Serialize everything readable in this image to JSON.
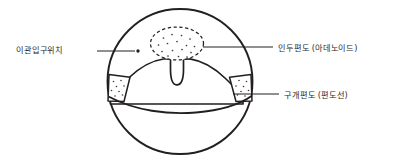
{
  "figure": {
    "background_color": "#ffffff",
    "line_color": "#231f20",
    "text_color": "#2b2b2b",
    "stipple_color": "#3a3a3a"
  },
  "labels": {
    "eustachian_opening": "이관입구위치",
    "adenoid": "인두편도 (아데노이드)",
    "palatine_tonsil": "구개편도 (편도선)"
  },
  "structures": {
    "outer_circle": "view-circle",
    "adenoid_region": "dashed-stippled-oval",
    "uvula": "uvula-protrusion",
    "soft_palate": "soft-palate-arch",
    "left_tonsil": "left-palatine-tonsil",
    "right_tonsil": "right-palatine-tonsil",
    "tongue": "tongue-curve",
    "eustachian_marker": "dot-marker"
  },
  "leader_lines": {
    "eustachian": "left-horizontal",
    "adenoid": "right-horizontal-upper",
    "palatine": "right-horizontal-lower"
  }
}
